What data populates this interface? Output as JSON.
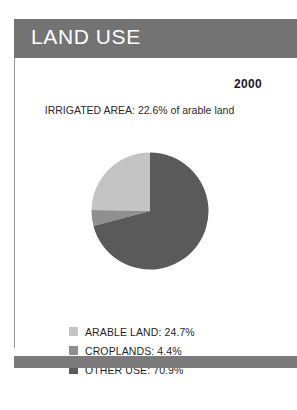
{
  "card": {
    "header_title": "LAND USE",
    "year": "2000",
    "subtitle": "IRRIGATED AREA: 22.6% of arable land"
  },
  "colors": {
    "header_bar": "#737373",
    "footer_bar": "#7b7b7b",
    "arable_land": "#c4c4c4",
    "croplands": "#8f8f8f",
    "other_use": "#5a5a5a",
    "card_border": "#9a9a9a",
    "text": "#1f1f1f"
  },
  "legend": {
    "items": [
      {
        "label": "ARABLE LAND: 24.7%",
        "color": "#c4c4c4",
        "swatch_name": "legend-swatch-arable-land"
      },
      {
        "label": "CROPLANDS: 4.4%",
        "color": "#8f8f8f",
        "swatch_name": "legend-swatch-croplands"
      },
      {
        "label": "OTHER USE: 70.9%",
        "color": "#5a5a5a",
        "swatch_name": "legend-swatch-other-use"
      }
    ]
  },
  "chart_data": {
    "type": "pie",
    "title": "LAND USE",
    "subtitle": "IRRIGATED AREA: 22.6% of arable land",
    "year": "2000",
    "categories": [
      "ARABLE LAND",
      "CROPLANDS",
      "OTHER USE"
    ],
    "values": [
      24.7,
      4.4,
      70.9
    ],
    "unit": "%",
    "colors": [
      "#c4c4c4",
      "#8f8f8f",
      "#5a5a5a"
    ],
    "start_angle_deg": 0,
    "direction": "counterclockwise",
    "legend_position": "bottom",
    "labels": [
      "ARABLE LAND: 24.7%",
      "CROPLANDS: 4.4%",
      "OTHER USE: 70.9%"
    ],
    "annotations": [
      "IRRIGATED AREA: 22.6% of arable land"
    ]
  }
}
